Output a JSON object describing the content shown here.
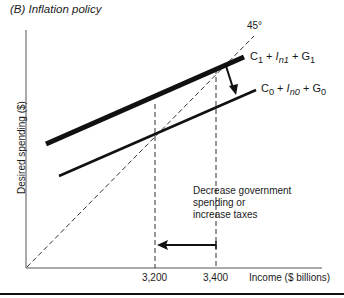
{
  "panel": {
    "title": "(B) Inflation policy"
  },
  "axes": {
    "ylabel": "Desired spending ($)",
    "xlabel": "Income ($ billions)",
    "ticks": [
      {
        "label": "3,200"
      },
      {
        "label": "3,400"
      }
    ]
  },
  "lines": {
    "reference_45": {
      "label": "45°"
    },
    "ae_high": {
      "c": "C",
      "c_sub": "1",
      "i": "I",
      "i_sub": "n1",
      "g": "G",
      "g_sub": "1",
      "plus": "+"
    },
    "ae_low": {
      "c": "C",
      "c_sub": "0",
      "i": "I",
      "i_sub": "n0",
      "g": "G",
      "g_sub": "0",
      "plus": "+"
    }
  },
  "annotation": {
    "line1": "Decrease government",
    "line2": "spending or",
    "line3": "increase taxes"
  },
  "colors": {
    "ink": "#1a1a1a",
    "background": "#ffffff"
  }
}
